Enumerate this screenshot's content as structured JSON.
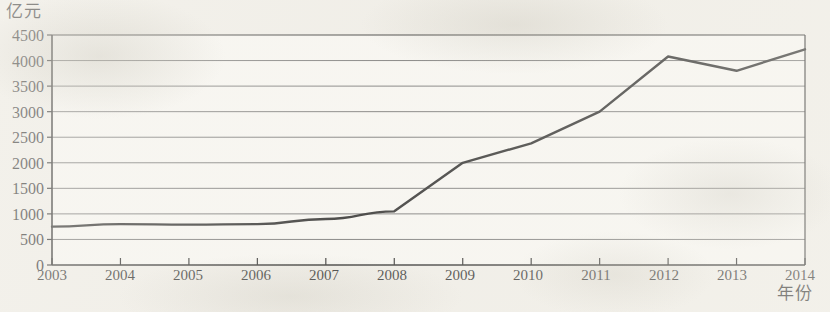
{
  "chart_data": {
    "type": "line",
    "title": "",
    "subtitle": "",
    "xlabel": "年份",
    "ylabel": "亿元",
    "unit_label": "亿元",
    "categories": [
      "2003",
      "2004",
      "2005",
      "2006",
      "2007",
      "2008",
      "2009",
      "2010",
      "2011",
      "2012",
      "2013",
      "2014"
    ],
    "x": [
      2003,
      2004,
      2005,
      2006,
      2007,
      2008,
      2009,
      2010,
      2011,
      2012,
      2013,
      2014
    ],
    "values": [
      750,
      800,
      790,
      800,
      900,
      1050,
      2000,
      2380,
      3000,
      4080,
      3800,
      4220
    ],
    "series": [
      {
        "name": "",
        "values": [
          750,
          800,
          790,
          800,
          900,
          1050,
          2000,
          2380,
          3000,
          4080,
          3800,
          4220
        ]
      }
    ],
    "ylim": [
      0,
      4500
    ],
    "xlim": [
      2003,
      2014
    ],
    "yticks": [
      0,
      500,
      1000,
      1500,
      2000,
      2500,
      3000,
      3500,
      4000,
      4500
    ],
    "ytick_labels": [
      "0",
      "500",
      "1000",
      "1500",
      "2000",
      "2500",
      "3000",
      "3500",
      "4000",
      "4500"
    ],
    "xtick_labels": [
      "2003",
      "2004",
      "2005",
      "2006",
      "2007",
      "2008",
      "2009",
      "2010",
      "2011",
      "2012",
      "2013",
      "2014"
    ],
    "grid": "horizontal",
    "legend": "none",
    "line_color": "#191919",
    "grid_color": "#6b6b6b",
    "axis_color": "#1a1a1a",
    "plot_background": "#fbfaf6",
    "page_background": "#f2f0ea",
    "annotations": []
  }
}
